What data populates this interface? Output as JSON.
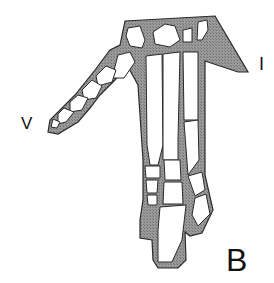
{
  "figure": {
    "panel_label": "B",
    "digit_labels": {
      "first": "I",
      "fifth": "V"
    },
    "colors": {
      "tissue_fill": "#8f8f8f",
      "bone_fill": "#ffffff",
      "outline": "#2a2a2a",
      "background": "#ffffff"
    }
  }
}
